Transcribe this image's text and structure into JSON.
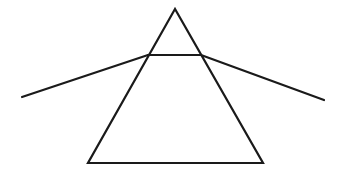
{
  "diagram": {
    "type": "prism-refraction",
    "canvas": {
      "width": 342,
      "height": 176,
      "background": "#ffffff"
    },
    "stroke_color": "#1a1a1a",
    "prism": {
      "apex": [
        175,
        9
      ],
      "bottom_left": [
        88,
        163
      ],
      "bottom_right": [
        263,
        163
      ]
    },
    "light_ray": {
      "incident_start": [
        22,
        97
      ],
      "entry_point": [
        148,
        55
      ],
      "exit_point": [
        201,
        55
      ],
      "emergent_end": [
        324,
        100
      ]
    }
  }
}
